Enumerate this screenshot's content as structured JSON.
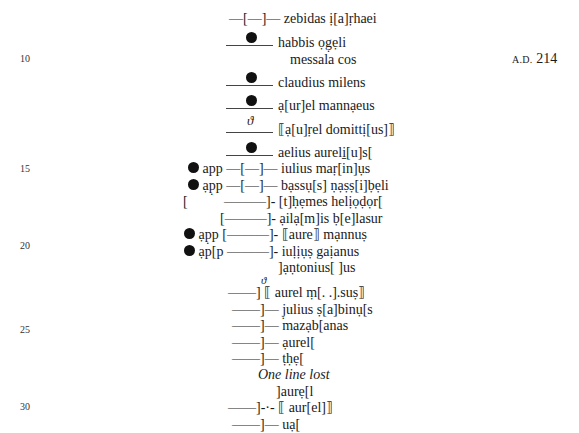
{
  "margin": {
    "line_numbers": [
      "10",
      "15",
      "20",
      "25",
      "30"
    ],
    "date": {
      "era": "A.D.",
      "year": "214"
    }
  },
  "lines": [
    {
      "prefix": "—[—]—",
      "text": "zebidas ị[a]ṛhaei"
    },
    {
      "mark": "dot",
      "text": "habbis   ọg̣ẹli"
    },
    {
      "text": "messala cos"
    },
    {
      "mark": "dot",
      "text": "claudius milens"
    },
    {
      "mark": "dot",
      "text": "ạ[ur]el mannạeus"
    },
    {
      "mark": "theta",
      "theta_glyph": "ϑ",
      "text": "⟦ạ[u]ṛel   domittị[us]⟧"
    },
    {
      "mark": "dot",
      "text": "aelius aureli̱[u]s["
    },
    {
      "left_dot": true,
      "app": "app",
      "prefix": "—[—]—",
      "text": "iulius maṛ[in]ụs"
    },
    {
      "left_dot": true,
      "app": "ạp̣p",
      "prefix": "—[—]—",
      "text": "bạssụ[s] ṇạṣṣ[i]ḅẹli"
    },
    {
      "bracket": "[",
      "prefix": "———]-",
      "text": "[t]ḥẹmes   helịọḍọr["
    },
    {
      "prefix": "[———]-",
      "text": "ạilạ[m]is ḅ[e]lasur"
    },
    {
      "left_dot": true,
      "app": "ạp̣p",
      "prefix": "[———]-",
      "text": "⟦aure⟧   mạnnuṣ"
    },
    {
      "left_dot": true,
      "app": "ạp[p",
      "prefix": "———]-",
      "text": "iuḷịụṣ gaịanus"
    },
    {
      "text": "]ạṇtonius[   ]us"
    },
    {
      "prefix": "——]",
      "theta_glyph": "ϑ",
      "text": "⟦ aurel   ṃ[. .].suṣ⟧"
    },
    {
      "prefix": "——]—",
      "text": "j̣ulius ṣ[a]binụ[s"
    },
    {
      "prefix": "——]—",
      "text": "mazạb[anas"
    },
    {
      "prefix": "——]—",
      "text": "ạurel["
    },
    {
      "prefix": "——]—",
      "text": "ṭḥẹ["
    },
    {
      "lost": "One line lost"
    },
    {
      "text": "]aurẹ[l"
    },
    {
      "prefix": "——]-·-",
      "text": "⟦ aur[el]⟧"
    },
    {
      "prefix": "——]—",
      "text": "uạ["
    }
  ]
}
